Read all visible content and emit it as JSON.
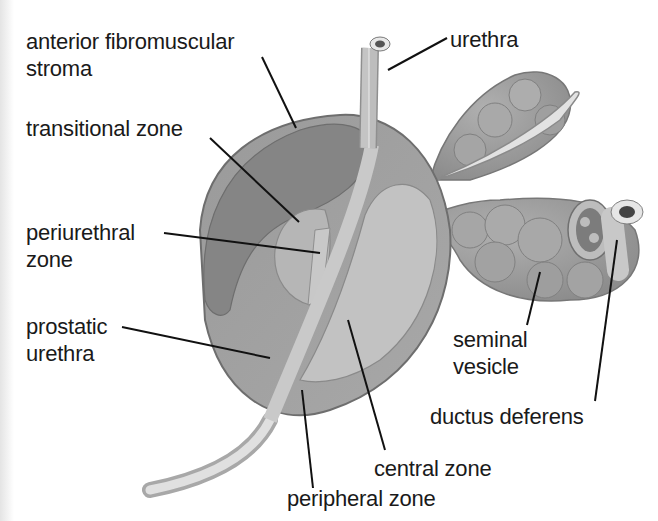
{
  "diagram": {
    "labels": [
      {
        "id": "anterior-fibromuscular-stroma",
        "lines": [
          "anterior fibromuscular",
          "stroma"
        ]
      },
      {
        "id": "urethra",
        "lines": [
          "urethra"
        ]
      },
      {
        "id": "transitional-zone",
        "lines": [
          "transitional zone"
        ]
      },
      {
        "id": "periurethral-zone",
        "lines": [
          "periurethral",
          "zone"
        ]
      },
      {
        "id": "prostatic-urethra",
        "lines": [
          "prostatic",
          "urethra"
        ]
      },
      {
        "id": "seminal-vesicle",
        "lines": [
          "seminal",
          "vesicle"
        ]
      },
      {
        "id": "ductus-deferens",
        "lines": [
          "ductus deferens"
        ]
      },
      {
        "id": "central-zone",
        "lines": [
          "central zone"
        ]
      },
      {
        "id": "peripheral-zone",
        "lines": [
          "peripheral zone"
        ]
      }
    ]
  },
  "colors": {
    "background": "#ffffff",
    "text": "#1a1a1a",
    "leader_line": "#111111",
    "stroma": "#8a8a8a",
    "peripheral": "#a3a3a3",
    "central": "#bdbdbd",
    "transitional": "#b3b3b3",
    "urethra": "#d4d4d4",
    "vesicle": "#9a9a9a",
    "outline": "#6e6e6e"
  }
}
